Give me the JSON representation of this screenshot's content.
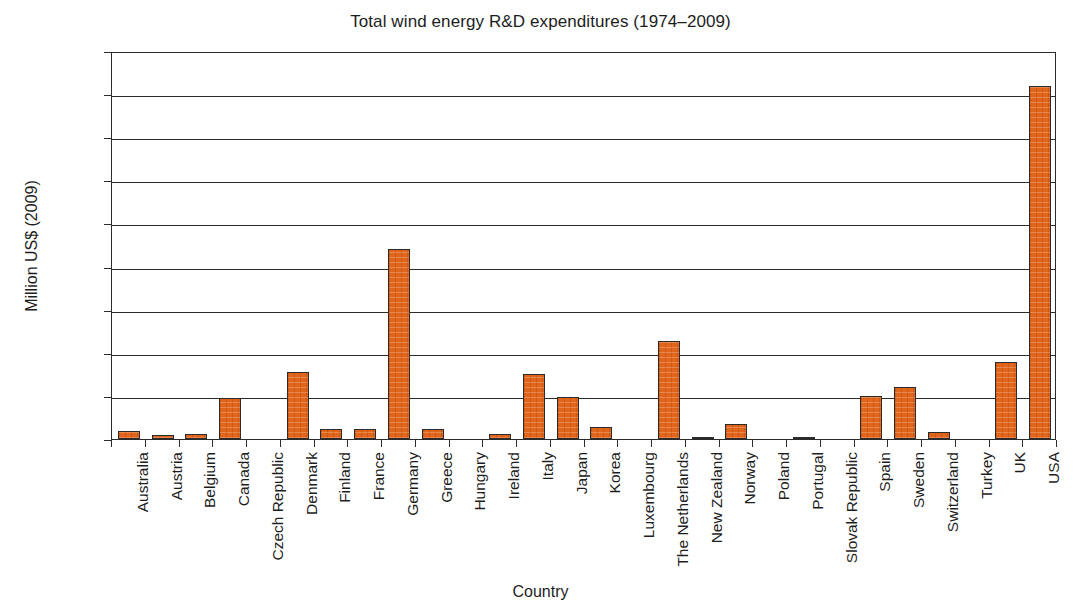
{
  "chart_data": {
    "type": "bar",
    "title": "Total wind energy R&D expenditures (1974–2009)",
    "xlabel": "Country",
    "ylabel": "Million US$ (2009)",
    "ylim": [
      0,
      1800
    ],
    "ytick_step": 200,
    "ytick_labels": [
      "1800",
      "1600",
      "1400",
      "1200",
      "1000",
      "800",
      "600",
      "400",
      "200",
      "0"
    ],
    "yticks": [
      1800,
      1600,
      1400,
      1200,
      1000,
      800,
      600,
      400,
      200,
      0
    ],
    "grid": "horizontal",
    "legend": "none",
    "bar_color": "#E2651C",
    "bar_edge_color": "#2B2B2B",
    "categories": [
      "Australia",
      "Austria",
      "Belgium",
      "Canada",
      "Czech Republic",
      "Denmark",
      "Finland",
      "France",
      "Germany",
      "Greece",
      "Hungary",
      "Ireland",
      "Italy",
      "Japan",
      "Korea",
      "Luxembourg",
      "The Netherlands",
      "New Zealand",
      "Norway",
      "Poland",
      "Portugal",
      "Slovak Republic",
      "Spain",
      "Sweden",
      "Switzerland",
      "Turkey",
      "UK",
      "USA"
    ],
    "values": [
      35,
      20,
      25,
      188,
      0,
      310,
      45,
      48,
      880,
      48,
      0,
      25,
      300,
      193,
      58,
      0,
      455,
      8,
      68,
      0,
      10,
      0,
      200,
      240,
      33,
      0,
      355,
      1640
    ]
  }
}
